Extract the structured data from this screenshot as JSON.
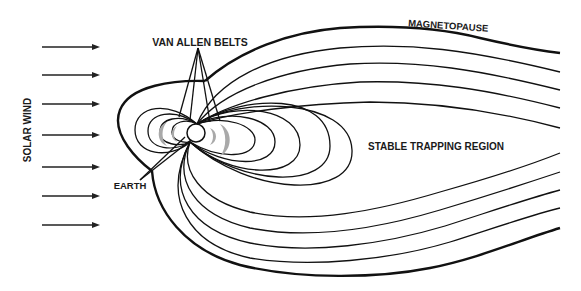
{
  "diagram": {
    "labels": {
      "solar_wind": "SOLAR WIND",
      "van_allen_belts": "VAN ALLEN BELTS",
      "magnetopause": "MAGNETOPAUSE",
      "stable_trapping_region": "STABLE TRAPPING REGION",
      "earth": "EARTH"
    },
    "solar_wind_arrow_count": 7,
    "colors": {
      "lines": "#111111",
      "belts": "#a9a9a9",
      "background": "#ffffff"
    }
  }
}
